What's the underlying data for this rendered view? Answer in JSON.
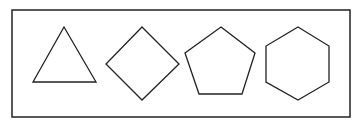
{
  "diagram": {
    "background": "#ffffff",
    "stroke_color": "#222222",
    "frame": {
      "x": 12,
      "y": 10,
      "width": 338,
      "height": 107,
      "stroke_width": 1.5
    },
    "shapes": [
      {
        "name": "triangle",
        "sides": 3,
        "points": "64,27 96,82 33,82"
      },
      {
        "name": "square-diamond",
        "sides": 4,
        "points": "142,27 179,64 142,100 106,64"
      },
      {
        "name": "pentagon",
        "sides": 5,
        "points": "221,27 255,53 242,94 199,94 185,53"
      },
      {
        "name": "hexagon",
        "sides": 6,
        "points": "298,27 329,46 329,82 298,100 266,82 266,46"
      }
    ]
  }
}
